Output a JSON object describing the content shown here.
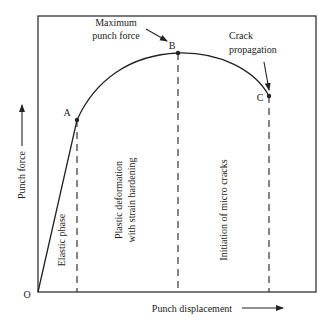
{
  "diagram": {
    "type": "punch-force-displacement-curve",
    "axes": {
      "y_label": "Punch force",
      "x_label": "Punch displacement",
      "origin_label": "O"
    },
    "points": [
      {
        "id": "A",
        "label": "A"
      },
      {
        "id": "B",
        "label": "B"
      },
      {
        "id": "C",
        "label": "C"
      }
    ],
    "annotations": {
      "max_force_line1": "Maximum",
      "max_force_line2": "punch force",
      "crack_line1": "Crack",
      "crack_line2": "propagation"
    },
    "regions": {
      "elastic": "Elastic phase",
      "plastic_line1": "Plastic deformation",
      "plastic_line2": "with strain hardening",
      "micro_cracks": "Initiation of micro cracks"
    },
    "colors": {
      "line": "#222222",
      "background": "#ffffff"
    }
  }
}
